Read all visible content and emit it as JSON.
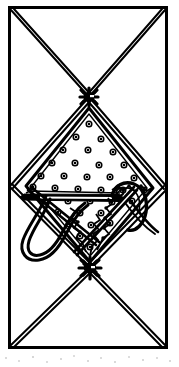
{
  "figure": {
    "title": "Geometric line-art diagram with stippled diamond, needle and hooked thread",
    "medium": "black ink line drawing on white ground",
    "ink_color": "#000000",
    "paper_color": "#ffffff",
    "canvas": {
      "width": 179,
      "height": 367
    },
    "frame": {
      "name": "outer-rectangle-border",
      "x": 8,
      "y": 6,
      "width": 160,
      "height": 343,
      "stroke_width": 3
    },
    "knots": [
      {
        "name": "upper-knot",
        "cx": 89,
        "cy": 97,
        "radius": 9,
        "ray_count": 8
      },
      {
        "name": "lower-knot",
        "cx": 90,
        "cy": 268,
        "radius": 10,
        "ray_count": 9
      }
    ],
    "diagonals": {
      "name": "doubled-x-diagonals",
      "stroke_width": 2,
      "offset": 2.5,
      "segments": [
        {
          "name": "upper-left-to-knot",
          "x1": 10,
          "y1": 9,
          "x2": 89,
          "y2": 97
        },
        {
          "name": "upper-right-to-knot",
          "x1": 166,
          "y1": 9,
          "x2": 89,
          "y2": 97
        },
        {
          "name": "knot-to-left-vertex",
          "x1": 89,
          "y1": 97,
          "x2": 10,
          "y2": 186
        },
        {
          "name": "knot-to-right-vertex",
          "x1": 89,
          "y1": 97,
          "x2": 167,
          "y2": 188
        },
        {
          "name": "left-vertex-to-lower-knot",
          "x1": 10,
          "y1": 186,
          "x2": 90,
          "y2": 268
        },
        {
          "name": "right-vertex-to-lower-knot",
          "x1": 167,
          "y1": 188,
          "x2": 90,
          "y2": 268
        },
        {
          "name": "lower-knot-to-bottom-left",
          "x1": 90,
          "y1": 268,
          "x2": 11,
          "y2": 346
        },
        {
          "name": "lower-knot-to-bottom-right",
          "x1": 90,
          "y1": 268,
          "x2": 166,
          "y2": 346
        }
      ]
    },
    "diamond": {
      "name": "central-stippled-diamond",
      "top": {
        "x": 89,
        "y": 108
      },
      "left": {
        "x": 26,
        "y": 186
      },
      "right": {
        "x": 153,
        "y": 188
      },
      "bottom": {
        "x": 90,
        "y": 262
      },
      "stroke_width": 3
    },
    "stipple_dots": {
      "name": "stipple-dot-field",
      "count": 34,
      "outer_radius": 2.8,
      "inner_radius": 1.3,
      "points": [
        [
          89,
          124
        ],
        [
          76,
          137
        ],
        [
          101,
          139
        ],
        [
          63,
          150
        ],
        [
          88,
          150
        ],
        [
          113,
          152
        ],
        [
          52,
          163
        ],
        [
          75,
          163
        ],
        [
          99,
          165
        ],
        [
          124,
          165
        ],
        [
          41,
          176
        ],
        [
          64,
          176
        ],
        [
          87,
          177
        ],
        [
          110,
          177
        ],
        [
          134,
          178
        ],
        [
          33,
          187
        ],
        [
          55,
          188
        ],
        [
          78,
          189
        ],
        [
          101,
          190
        ],
        [
          123,
          190
        ],
        [
          144,
          190
        ],
        [
          46,
          200
        ],
        [
          68,
          201
        ],
        [
          90,
          201
        ],
        [
          112,
          202
        ],
        [
          132,
          201
        ],
        [
          58,
          212
        ],
        [
          80,
          213
        ],
        [
          101,
          213
        ],
        [
          69,
          224
        ],
        [
          91,
          225
        ],
        [
          110,
          223
        ],
        [
          80,
          236
        ],
        [
          90,
          247
        ]
      ]
    },
    "needle": {
      "name": "horizontal-needle-bar",
      "tip_x": 24,
      "tip_y": 196,
      "tail_x": 120,
      "tail_y": 198,
      "thickness": 5,
      "eye_slot": true
    },
    "hook": {
      "name": "curved-hook-loop",
      "description": "long U-shaped hook curving down-left then back up, crossing the needle shaft"
    },
    "thread_lines": {
      "name": "zigzag-thread-strands",
      "count": 3,
      "description": "beaded zigzag strands radiating from right loop toward lower knot"
    }
  }
}
